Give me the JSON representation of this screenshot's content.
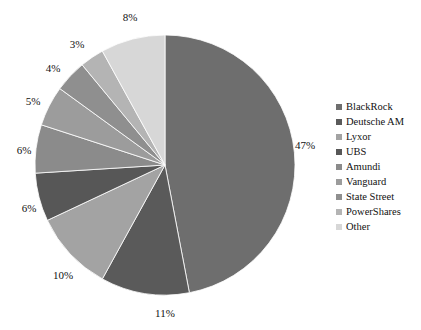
{
  "chart_data": {
    "type": "pie",
    "title": "",
    "subtitle": "",
    "xlabel": "",
    "ylabel": "",
    "legend_position": "right",
    "grid": false,
    "start_angle_deg": 0,
    "direction": "clockwise",
    "categories": [
      "BlackRock",
      "Deutsche AM",
      "Lyxor",
      "UBS",
      "Amundi",
      "Vanguard",
      "State Street",
      "PowerShares",
      "Other"
    ],
    "values": [
      47,
      11,
      10,
      6,
      6,
      5,
      4,
      3,
      8
    ],
    "value_labels": [
      "47%",
      "11%",
      "10%",
      "6%",
      "6%",
      "5%",
      "4%",
      "3%",
      "8%"
    ],
    "colors": [
      "#6e6e6e",
      "#5a5a5a",
      "#a3a3a3",
      "#575757",
      "#8b8b8b",
      "#9c9c9c",
      "#8f8f8f",
      "#b4b4b4",
      "#d7d7d7"
    ],
    "slices": [
      {
        "name": "BlackRock",
        "value": 47,
        "label": "47%",
        "color": "#6e6e6e",
        "label_x": 305,
        "label_y": 145
      },
      {
        "name": "Deutsche AM",
        "value": 11,
        "label": "11%",
        "color": "#5a5a5a",
        "label_x": 165,
        "label_y": 313
      },
      {
        "name": "Lyxor",
        "value": 10,
        "label": "10%",
        "color": "#a3a3a3",
        "label_x": 63,
        "label_y": 275
      },
      {
        "name": "UBS",
        "value": 6,
        "label": "6%",
        "color": "#575757",
        "label_x": 29,
        "label_y": 208
      },
      {
        "name": "Amundi",
        "value": 6,
        "label": "6%",
        "color": "#8b8b8b",
        "label_x": 24,
        "label_y": 150
      },
      {
        "name": "Vanguard",
        "value": 5,
        "label": "5%",
        "color": "#9c9c9c",
        "label_x": 33,
        "label_y": 101
      },
      {
        "name": "State Street",
        "value": 4,
        "label": "4%",
        "color": "#8f8f8f",
        "label_x": 53,
        "label_y": 68
      },
      {
        "name": "PowerShares",
        "value": 3,
        "label": "3%",
        "color": "#b4b4b4",
        "label_x": 77,
        "label_y": 44
      },
      {
        "name": "Other",
        "value": 8,
        "label": "8%",
        "color": "#d7d7d7",
        "label_x": 130,
        "label_y": 17
      }
    ],
    "geometry": {
      "center_x": 165,
      "center_y": 165,
      "radius": 130
    }
  },
  "legend": {
    "items": [
      {
        "label": "BlackRock",
        "color": "#6e6e6e"
      },
      {
        "label": "Deutsche AM",
        "color": "#5a5a5a"
      },
      {
        "label": "Lyxor",
        "color": "#a3a3a3"
      },
      {
        "label": "UBS",
        "color": "#575757"
      },
      {
        "label": "Amundi",
        "color": "#8b8b8b"
      },
      {
        "label": "Vanguard",
        "color": "#9c9c9c"
      },
      {
        "label": "State Street",
        "color": "#8f8f8f"
      },
      {
        "label": "PowerShares",
        "color": "#b4b4b4"
      },
      {
        "label": "Other",
        "color": "#d7d7d7"
      }
    ]
  }
}
